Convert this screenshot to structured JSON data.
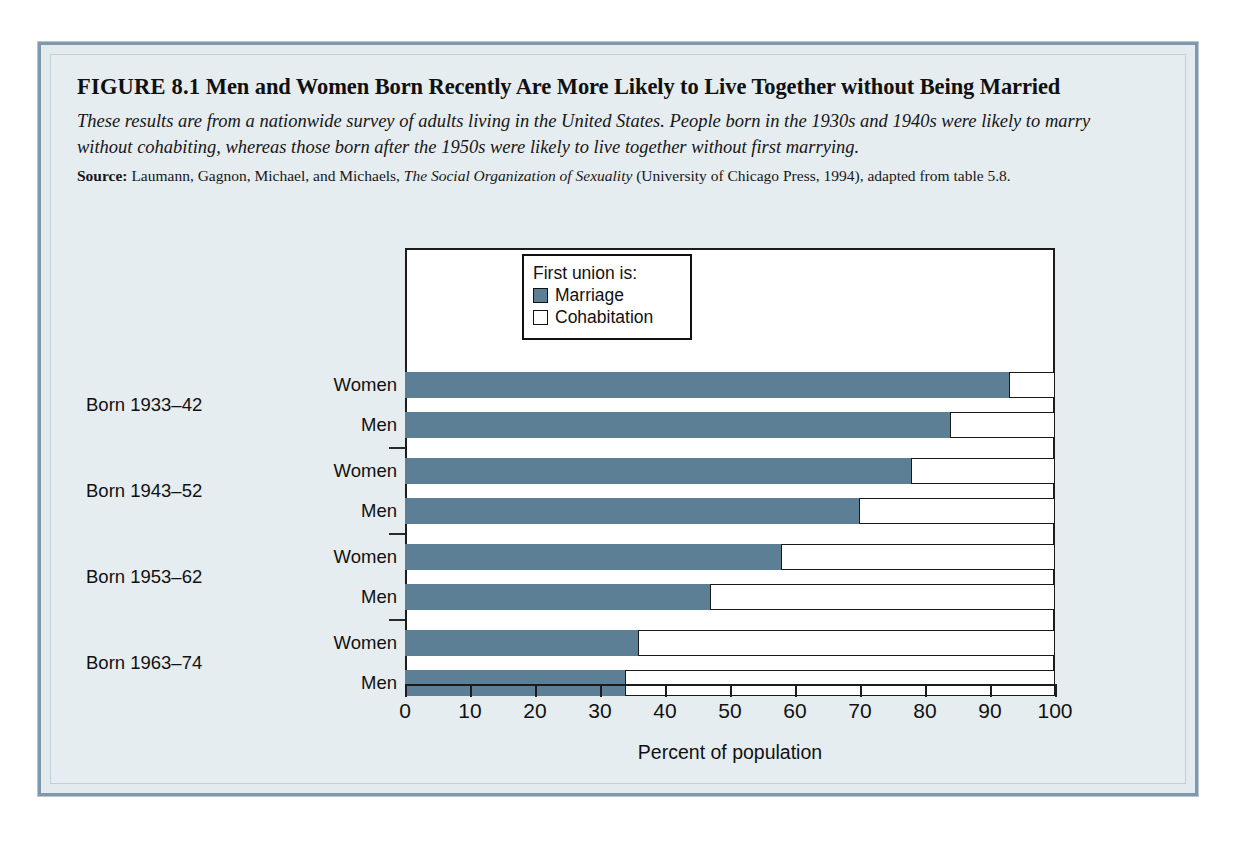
{
  "figure": {
    "label": "FIGURE 8.1",
    "title": "Men and Women Born Recently Are More Likely to Live Together without Being Married",
    "description": "These results are from a nationwide survey of adults living in the United States. People born in the 1930s and 1940s were likely to marry without cohabiting, whereas those born after the 1950s were likely to live together without first marrying.",
    "source_label": "Source:",
    "source_text_1": "Laumann, Gagnon, Michael, and Michaels,",
    "source_italic": "The Social Organization of Sexuality",
    "source_text_2": "(University of Chicago Press, 1994), adapted from table 5.8."
  },
  "colors": {
    "marriage": "#5c7f95",
    "cohabitation": "#ffffff",
    "frame": "#7e99ad",
    "background": "#e6edf0",
    "axis": "#1c1c1c"
  },
  "legend": {
    "title": "First union is:",
    "entries": [
      {
        "label": "Marriage",
        "swatch": "marriage"
      },
      {
        "label": "Cohabitation",
        "swatch": "cohabitation"
      }
    ]
  },
  "chart_data": {
    "type": "bar",
    "orientation": "horizontal",
    "stacked": true,
    "title": "Men and Women Born Recently Are More Likely to Live Together without Being Married",
    "xlabel": "Percent of population",
    "ylabel": "",
    "xlim": [
      0,
      100
    ],
    "xticks": [
      0,
      10,
      20,
      30,
      40,
      50,
      60,
      70,
      80,
      90,
      100
    ],
    "xtick_labels": [
      "0",
      "10",
      "20",
      "30",
      "40",
      "50",
      "60",
      "70",
      "80",
      "90",
      "100"
    ],
    "grid": false,
    "legend_position": "top-right",
    "legend_title": "First union is:",
    "series": [
      {
        "name": "Marriage",
        "color": "#5c7f95",
        "values": [
          93,
          84,
          78,
          70,
          58,
          47,
          36,
          34
        ]
      },
      {
        "name": "Cohabitation",
        "color": "#ffffff",
        "values": [
          7,
          16,
          22,
          30,
          42,
          53,
          64,
          66
        ]
      }
    ],
    "groups": [
      {
        "label": "Born 1933–42",
        "rows": [
          "Women",
          "Men"
        ]
      },
      {
        "label": "Born 1943–52",
        "rows": [
          "Women",
          "Men"
        ]
      },
      {
        "label": "Born 1953–62",
        "rows": [
          "Women",
          "Men"
        ]
      },
      {
        "label": "Born 1963–74",
        "rows": [
          "Women",
          "Men"
        ]
      }
    ],
    "categories": [
      "Born 1933–42 Women",
      "Born 1933–42 Men",
      "Born 1943–52 Women",
      "Born 1943–52 Men",
      "Born 1953–62 Women",
      "Born 1953–62 Men",
      "Born 1963–74 Women",
      "Born 1963–74 Men"
    ],
    "bars": [
      {
        "group": "Born 1933–42",
        "row": "Women",
        "marriage": 93,
        "cohabitation": 7
      },
      {
        "group": "Born 1933–42",
        "row": "Men",
        "marriage": 84,
        "cohabitation": 16
      },
      {
        "group": "Born 1943–52",
        "row": "Women",
        "marriage": 78,
        "cohabitation": 22
      },
      {
        "group": "Born 1943–52",
        "row": "Men",
        "marriage": 70,
        "cohabitation": 30
      },
      {
        "group": "Born 1953–62",
        "row": "Women",
        "marriage": 58,
        "cohabitation": 42
      },
      {
        "group": "Born 1953–62",
        "row": "Men",
        "marriage": 47,
        "cohabitation": 53
      },
      {
        "group": "Born 1963–74",
        "row": "Women",
        "marriage": 36,
        "cohabitation": 64
      },
      {
        "group": "Born 1963–74",
        "row": "Men",
        "marriage": 34,
        "cohabitation": 66
      }
    ]
  }
}
